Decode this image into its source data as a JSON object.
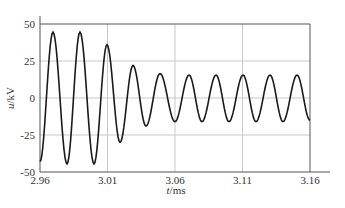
{
  "chart_data": {
    "type": "line",
    "title": "",
    "xlabel": "t/ms",
    "ylabel": "u/kV",
    "xlim": [
      2.96,
      3.16
    ],
    "ylim": [
      -50,
      50
    ],
    "xticks": [
      2.96,
      3.01,
      3.06,
      3.11,
      3.16
    ],
    "xtick_labels": [
      "2.96",
      "3.01",
      "3.06",
      "3.11",
      "3.16"
    ],
    "yticks": [
      -50,
      -25,
      0,
      25,
      50
    ],
    "ytick_labels": [
      "-50",
      "-25",
      "0",
      "25",
      "50"
    ],
    "grid": true,
    "legend": null,
    "series": [
      {
        "name": "u",
        "color": "#1a1a1a",
        "extrema": [
          [
            2.96,
            -43
          ],
          [
            2.9696,
            44.5
          ],
          [
            2.98,
            -44.5
          ],
          [
            2.9896,
            44.5
          ],
          [
            3.0,
            -44.5
          ],
          [
            3.0096,
            36
          ],
          [
            3.0193,
            -30
          ],
          [
            3.0289,
            22
          ],
          [
            3.0385,
            -19
          ],
          [
            3.0489,
            16.5
          ],
          [
            3.06,
            -16
          ],
          [
            3.0704,
            15.5
          ],
          [
            3.08,
            -16
          ],
          [
            3.0904,
            15.5
          ],
          [
            3.1,
            -16
          ],
          [
            3.1104,
            15.5
          ],
          [
            3.12,
            -16
          ],
          [
            3.1304,
            15.5
          ],
          [
            3.14,
            -16
          ],
          [
            3.1504,
            15.5
          ],
          [
            3.16,
            -15
          ]
        ]
      }
    ]
  },
  "axes": {
    "xlabel_italic": "t",
    "xlabel_unit": "/ms",
    "ylabel_italic": "u",
    "ylabel_unit": "/kV"
  },
  "colors": {
    "grid": "#c8c8c8",
    "axis": "#555555",
    "line": "#1a1a1a"
  }
}
